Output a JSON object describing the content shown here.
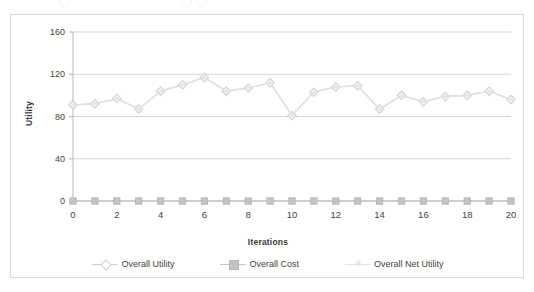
{
  "chart": {
    "axis_y_label": "Utility",
    "axis_x_label": "Iterations",
    "y_ticks": [
      "0",
      "40",
      "80",
      "120",
      "160"
    ],
    "x_ticks": [
      "0",
      "2",
      "4",
      "6",
      "8",
      "10",
      "12",
      "14",
      "16",
      "18",
      "20"
    ],
    "legend": [
      {
        "label": "Overall Utility",
        "marker": "diamond-marker",
        "color": "#cfcfcf"
      },
      {
        "label": "Overall Cost",
        "marker": "square-marker",
        "color": "#c4c4c4"
      },
      {
        "label": "Overall Net Utility",
        "marker": "star-marker",
        "color": "#e2e2e2"
      }
    ]
  },
  "chart_data": {
    "type": "line",
    "title": "",
    "xlabel": "Iterations",
    "ylabel": "Utility",
    "xlim": [
      0,
      20
    ],
    "ylim": [
      0,
      160
    ],
    "yticks": [
      0,
      40,
      80,
      120,
      160
    ],
    "xticks": [
      0,
      2,
      4,
      6,
      8,
      10,
      12,
      14,
      16,
      18,
      20
    ],
    "grid": "horizontal",
    "legend_position": "bottom",
    "x": [
      0,
      1,
      2,
      3,
      4,
      5,
      6,
      7,
      8,
      9,
      10,
      11,
      12,
      13,
      14,
      15,
      16,
      17,
      18,
      19,
      20
    ],
    "series": [
      {
        "name": "Overall Utility",
        "marker": "diamond",
        "color": "#cfcfcf",
        "values": [
          91,
          92,
          97,
          87,
          104,
          110,
          117,
          104,
          107,
          112,
          81,
          103,
          108,
          109,
          87,
          100,
          94,
          99,
          100,
          104,
          96
        ]
      },
      {
        "name": "Overall Cost",
        "marker": "square",
        "color": "#c4c4c4",
        "values": [
          0,
          0,
          0,
          0,
          0,
          0,
          0,
          0,
          0,
          0,
          0,
          0,
          0,
          0,
          0,
          0,
          0,
          0,
          0,
          0,
          0
        ]
      },
      {
        "name": "Overall Net Utility",
        "marker": "star",
        "color": "#e2e2e2",
        "values": [
          91,
          92,
          97,
          87,
          104,
          110,
          117,
          104,
          107,
          112,
          81,
          103,
          108,
          109,
          87,
          100,
          94,
          99,
          100,
          104,
          96
        ]
      }
    ]
  }
}
